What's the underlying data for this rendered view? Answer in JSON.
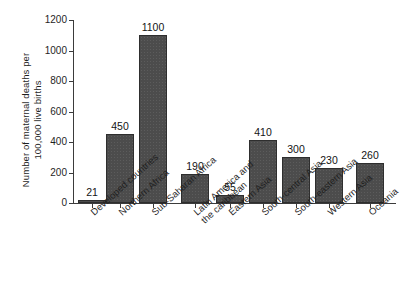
{
  "chart_data": {
    "type": "bar",
    "title": "",
    "xlabel": "",
    "ylabel": "Number of maternal deaths per\n100,000 live births",
    "ylim": [
      0,
      1200
    ],
    "yticks": [
      0,
      200,
      400,
      600,
      800,
      1000,
      1200
    ],
    "ytick_labels": [
      "0",
      "200",
      "400",
      "600",
      "800",
      "1000",
      "1200"
    ],
    "grid": false,
    "legend": "none",
    "categories": [
      "Developed countries",
      "Northern Africa",
      "Sub-Saharan Africa",
      "Latin America and\nthe caribbean",
      "Eastern Asia",
      "South-central Asia",
      "South-eastern Asia",
      "Western Asia",
      "Oceania"
    ],
    "values": [
      21,
      450,
      1100,
      190,
      55,
      410,
      300,
      230,
      260
    ],
    "value_labels": [
      "21",
      "450",
      "1100",
      "190",
      "55",
      "410",
      "300",
      "230",
      "260"
    ],
    "series": [
      {
        "name": "Maternal mortality ratio",
        "values": [
          21,
          450,
          1100,
          190,
          55,
          410,
          300,
          230,
          260
        ]
      }
    ],
    "bar_color": "#4c4c4c",
    "axis_color": "#3b3b3b",
    "background": "#ffffff"
  }
}
